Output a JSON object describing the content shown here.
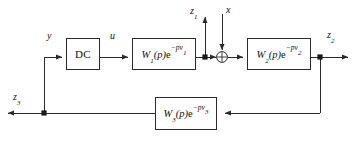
{
  "diagram": {
    "type": "control-system-block-diagram",
    "stroke_color": "#2a2a2a",
    "background_color": "#ffffff",
    "blocks": [
      {
        "id": "dc",
        "label": "DC",
        "base": "DC",
        "sub": "",
        "exp_sub": ""
      },
      {
        "id": "w1",
        "label": "W1(p)e^-pv1",
        "base": "W",
        "sub": "1",
        "exp_sub": "1"
      },
      {
        "id": "w2",
        "label": "W2(p)e^-pv2",
        "base": "W",
        "sub": "2",
        "exp_sub": "2"
      },
      {
        "id": "w3",
        "label": "W3(p)e^-pv3",
        "base": "W",
        "sub": "3",
        "exp_sub": "3"
      }
    ],
    "signals": [
      {
        "id": "y",
        "label": "y",
        "sub": "",
        "role": "input"
      },
      {
        "id": "u",
        "label": "u",
        "sub": "",
        "role": "internal"
      },
      {
        "id": "z1",
        "label": "z",
        "sub": "1",
        "role": "output"
      },
      {
        "id": "x",
        "label": "x",
        "sub": "",
        "role": "disturbance-input"
      },
      {
        "id": "z2",
        "label": "z",
        "sub": "2",
        "role": "output"
      },
      {
        "id": "z3",
        "label": "z",
        "sub": "3",
        "role": "output"
      }
    ],
    "summing_junction": {
      "id": "sum",
      "symbol": "plus-cross"
    },
    "block_text": {
      "dc": "DC",
      "w_letter": "W",
      "p_arg": "(p)",
      "e_letter": "e",
      "exp_prefix": "−pν"
    }
  }
}
